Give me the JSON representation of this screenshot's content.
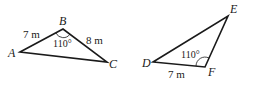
{
  "figures": [
    {
      "name": "triangle-abc",
      "vertices": {
        "A": "A",
        "B": "B",
        "C": "C"
      },
      "side_ab": "7 m",
      "side_bc": "8 m",
      "angle_b": "110°"
    },
    {
      "name": "triangle-def",
      "vertices": {
        "D": "D",
        "E": "E",
        "F": "F"
      },
      "side_df": "7 m",
      "angle_f": "110°"
    }
  ],
  "colors": {
    "stroke": "#1a1a1a",
    "background": "#ffffff"
  }
}
